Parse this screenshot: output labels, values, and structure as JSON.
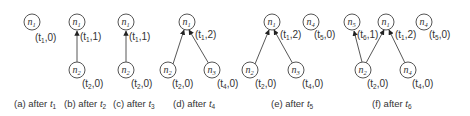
{
  "panels": [
    {
      "id": "a",
      "caption": "(a) after ",
      "caption_t": "t",
      "caption_sub": "1",
      "nodes": [
        {
          "name": "n",
          "sub": "1",
          "x": 34,
          "y": 23,
          "tag": "(t1,0)"
        }
      ],
      "edges": []
    },
    {
      "id": "b",
      "caption": "(b) after ",
      "caption_t": "t",
      "caption_sub": "2"
    },
    {
      "id": "c",
      "caption": "(c) after ",
      "caption_t": "t",
      "caption_sub": "3"
    },
    {
      "id": "d",
      "caption": "(d) after ",
      "caption_t": "t",
      "caption_sub": "4"
    },
    {
      "id": "e",
      "caption": "(e) after ",
      "caption_t": "t",
      "caption_sub": "5"
    },
    {
      "id": "f",
      "caption": "(f) after ",
      "caption_t": "t",
      "caption_sub": "6"
    }
  ],
  "labels": {
    "a_n1": "n",
    "a_n1s": "1",
    "a_tag": "(t",
    "a_tags": "1",
    "a_tagv": ",0)",
    "b_n1": "n",
    "b_n1s": "1",
    "b_n2": "n",
    "b_n2s": "2",
    "b_t1": "(t",
    "b_t1s": "1",
    "b_t1v": ",1)",
    "b_t2": "(t",
    "b_t2s": "2",
    "b_t2v": ",0)",
    "c_n1": "n",
    "c_n1s": "1",
    "c_n2": "n",
    "c_n2s": "2",
    "c_t1": "(t",
    "c_t1s": "1",
    "c_t1v": ",1)",
    "c_t2": "(t",
    "c_t2s": "2",
    "c_t2v": ",0)",
    "d_n1": "n",
    "d_n1s": "1",
    "d_n2": "n",
    "d_n2s": "2",
    "d_n3": "n",
    "d_n3s": "3",
    "d_t1": "(t",
    "d_t1s": "1",
    "d_t1v": ",2)",
    "d_t2": "(t",
    "d_t2s": "2",
    "d_t2v": ",0)",
    "d_t3": "(t",
    "d_t3s": "4",
    "d_t3v": ",0)",
    "e_n1": "n",
    "e_n1s": "1",
    "e_n4": "n",
    "e_n4s": "4",
    "e_n2": "n",
    "e_n2s": "2",
    "e_n3": "n",
    "e_n3s": "3",
    "e_t1": "(t",
    "e_t1s": "1",
    "e_t1v": ",2)",
    "e_t4": "(t",
    "e_t4s": "5",
    "e_t4v": ",0)",
    "e_t2": "(t",
    "e_t2s": "2",
    "e_t2v": ",0)",
    "e_t3": "(t",
    "e_t3s": "4",
    "e_t3v": ",0)",
    "f_n5": "n",
    "f_n5s": "5",
    "f_n1": "n",
    "f_n1s": "1",
    "f_n4a": "n",
    "f_n4as": "4",
    "f_n2": "n",
    "f_n2s": "2",
    "f_n4b": "n",
    "f_n4bs": "4",
    "f_t5": "(t",
    "f_t5s": "6",
    "f_t5v": ",1)",
    "f_t1": "(t",
    "f_t1s": "1",
    "f_t1v": ",2)",
    "f_t4": "(t",
    "f_t4s": "5",
    "f_t4v": ",0)",
    "f_t2": "(t",
    "f_t2s": "2",
    "f_t2v": ",0)",
    "f_t3": "(t",
    "f_t3s": "4",
    "f_t3v": ",0)"
  },
  "captions": {
    "a": "(a) after ",
    "a_t": "t",
    "a_s": "1",
    "b": "(b) after ",
    "b_t": "t",
    "b_s": "2",
    "c": "(c) after ",
    "c_t": "t",
    "c_s": "3",
    "d": "(d) after ",
    "d_t": "t",
    "d_s": "4",
    "e": "(e) after ",
    "e_t": "t",
    "e_s": "5",
    "f": "(f) after ",
    "f_t": "t",
    "f_s": "6"
  }
}
